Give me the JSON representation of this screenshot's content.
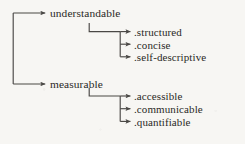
{
  "diagram": {
    "type": "tree",
    "title": "",
    "orientation": "left-to-right",
    "depth": 2,
    "line_color": "#4a4845",
    "text_color": "#2a2926",
    "background_color": "#f7f6f3",
    "root": {
      "label": "",
      "trunk_x": 13,
      "trunk_top_y": 13,
      "trunk_bottom_y": 84
    },
    "branches": [
      {
        "label": "understandable",
        "x": 50,
        "y": 13,
        "arrow_tip_x": 46,
        "hook_x": 89,
        "hook_y": 23,
        "distributor_x": 120,
        "children": [
          {
            "label": ".structured",
            "x": 134,
            "y": 32,
            "arrow_tip_x": 131
          },
          {
            "label": ".concise",
            "x": 134,
            "y": 44,
            "arrow_tip_x": 131
          },
          {
            "label": ".self-descriptive",
            "x": 134,
            "y": 57,
            "arrow_tip_x": 131
          }
        ]
      },
      {
        "label": "measurable",
        "x": 50,
        "y": 84,
        "arrow_tip_x": 46,
        "hook_x": 89,
        "hook_y": 88,
        "distributor_x": 120,
        "children": [
          {
            "label": ".accessible",
            "x": 134,
            "y": 96,
            "arrow_tip_x": 131
          },
          {
            "label": ".communicable",
            "x": 134,
            "y": 109,
            "arrow_tip_x": 131
          },
          {
            "label": ".quantifiable",
            "x": 134,
            "y": 122,
            "arrow_tip_x": 131
          }
        ]
      }
    ]
  }
}
